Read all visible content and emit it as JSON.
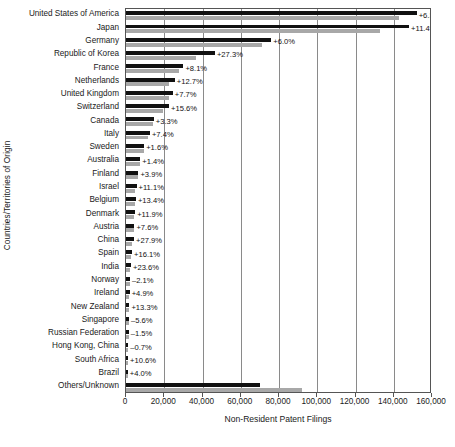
{
  "chart_data": {
    "type": "bar",
    "title": "",
    "xlabel": "Non-Resident Patent Filings",
    "ylabel": "Countries/Territories of Origin",
    "orientation": "horizontal",
    "grid": true,
    "legend": "none",
    "xlim": [
      0,
      160000
    ],
    "xticks": [
      0,
      20000,
      40000,
      60000,
      80000,
      100000,
      120000,
      140000,
      160000
    ],
    "xtick_labels": [
      "0",
      "20,000",
      "40,000",
      "60,000",
      "80,000",
      "100,000",
      "120,000",
      "140,000",
      "160,000"
    ],
    "categories": [
      "United States of America",
      "Japan",
      "Germany",
      "Republic of Korea",
      "France",
      "Netherlands",
      "United Kingdom",
      "Switzerland",
      "Canada",
      "Italy",
      "Sweden",
      "Australia",
      "Finland",
      "Israel",
      "Belgium",
      "Denmark",
      "Austria",
      "China",
      "Spain",
      "India",
      "Norway",
      "Ireland",
      "New Zealand",
      "Singapore",
      "Russian Federation",
      "Hong Kong, China",
      "South Africa",
      "Brazil",
      "Others/Unknown"
    ],
    "series": [
      {
        "name": "current-year",
        "color": "#111111",
        "values": [
          152000,
          148000,
          76000,
          46500,
          30000,
          25500,
          24500,
          22500,
          14500,
          12500,
          9500,
          7500,
          6500,
          5500,
          5200,
          4800,
          4400,
          4200,
          3200,
          2600,
          2000,
          1900,
          1800,
          1500,
          1400,
          1200,
          1100,
          900,
          70000
        ]
      },
      {
        "name": "previous-year",
        "color": "#a8a8a8",
        "values": [
          143000,
          133000,
          71000,
          36500,
          27800,
          22600,
          22700,
          19500,
          14000,
          11600,
          9300,
          7400,
          6300,
          4900,
          4600,
          4300,
          4100,
          3300,
          2750,
          2100,
          2050,
          1800,
          1600,
          1600,
          1420,
          1210,
          1000,
          865,
          92000
        ]
      }
    ],
    "annotations": [
      "+6.3%",
      "+11.4%",
      "+6.0%",
      "+27.3%",
      "+8.1%",
      "+12.7%",
      "+7.7%",
      "+15.6%",
      "+3.3%",
      "+7.4%",
      "+1.6%",
      "+1.4%",
      "+3.9%",
      "+11.1%",
      "+13.4%",
      "+11.9%",
      "+7.6%",
      "+27.9%",
      "+16.1%",
      "+23.6%",
      "–2.1%",
      "+4.9%",
      "+13.3%",
      "–5.6%",
      "–1.5%",
      "–0.7%",
      "+10.6%",
      "+4.0%",
      ""
    ]
  }
}
